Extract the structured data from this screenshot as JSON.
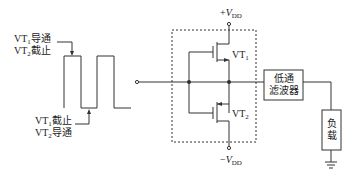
{
  "diagram": {
    "type": "circuit",
    "waveform": {
      "annotation_high": {
        "line1": {
          "prefix": "VT",
          "sub": "1",
          "text": "导通"
        },
        "line2": {
          "prefix": "VT",
          "sub": "2",
          "text": "截止"
        }
      },
      "annotation_low": {
        "line1": {
          "prefix": "VT",
          "sub": "1",
          "text": "截止"
        },
        "line2": {
          "prefix": "VT",
          "sub": "2",
          "text": "导通"
        }
      }
    },
    "transistors": [
      {
        "id": "VT1",
        "prefix": "VT",
        "sub": "1"
      },
      {
        "id": "VT2",
        "prefix": "VT",
        "sub": "2"
      }
    ],
    "supply_positive": {
      "sign": "+",
      "var": "V",
      "sub": "DD"
    },
    "supply_negative": {
      "sign": "−",
      "var": "V",
      "sub": "DD"
    },
    "filter": {
      "line1": "低通",
      "line2": "滤波器"
    },
    "load": {
      "line1": "负",
      "line2": "载"
    },
    "colors": {
      "stroke": "#333333",
      "background": "#ffffff"
    }
  }
}
